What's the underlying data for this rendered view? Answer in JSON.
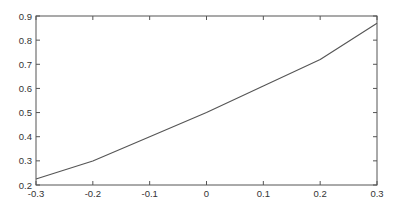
{
  "chart_data": {
    "type": "line",
    "title": "",
    "xlabel": "",
    "ylabel": "",
    "xlim": [
      -0.3,
      0.3
    ],
    "ylim": [
      0.2,
      0.9
    ],
    "grid": false,
    "legend": null,
    "x_ticks": [
      "-0.3",
      "-0.2",
      "-0.1",
      "0",
      "0.1",
      "0.2",
      "0.3"
    ],
    "y_ticks": [
      "0.2",
      "0.3",
      "0.4",
      "0.5",
      "0.6",
      "0.7",
      "0.8",
      "0.9"
    ],
    "series": [
      {
        "name": "curve",
        "x": [
          -0.3,
          -0.2,
          -0.1,
          0.0,
          0.1,
          0.2,
          0.3
        ],
        "values": [
          0.225,
          0.3,
          0.4,
          0.5,
          0.61,
          0.72,
          0.87
        ],
        "color": "#555555"
      }
    ]
  },
  "style": {
    "background": "#ffffff",
    "axis_color": "#555555",
    "text_color": "#333333"
  }
}
